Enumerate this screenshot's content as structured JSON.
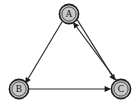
{
  "figure": {
    "background_color": "#ffffff",
    "width": 136,
    "height": 112
  },
  "graph": {
    "type": "directed-graph",
    "node_fill_color": "#c9c9c9",
    "node_stroke_color": "#1c1c1c",
    "edge_color": "#2a2a2a",
    "nodes": [
      {
        "id": "A",
        "label": "A",
        "cx": 69,
        "cy": 14,
        "r": 10
      },
      {
        "id": "B",
        "label": "B",
        "cx": 19,
        "cy": 89,
        "r": 10
      },
      {
        "id": "C",
        "label": "C",
        "cx": 121,
        "cy": 89,
        "r": 10
      }
    ],
    "edges": [
      {
        "id": "a-to-b",
        "from": "A",
        "to": "B",
        "directed": true,
        "style": "straight"
      },
      {
        "id": "b-to-c",
        "from": "B",
        "to": "C",
        "directed": true,
        "style": "straight"
      },
      {
        "id": "a-to-c",
        "from": "A",
        "to": "C",
        "directed": true,
        "style": "straight-parallel"
      },
      {
        "id": "c-to-a",
        "from": "C",
        "to": "A",
        "directed": true,
        "style": "straight-parallel"
      }
    ]
  }
}
